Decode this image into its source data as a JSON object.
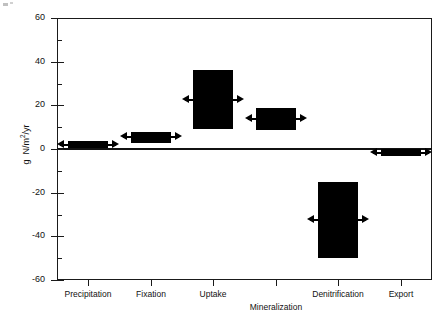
{
  "chart_data": {
    "type": "bar",
    "title": "",
    "xlabel": "",
    "ylabel": "g N/m2/yr",
    "ylabel_parts": {
      "prefix": "g  N/m",
      "sup": "2",
      "suffix": "/yr"
    },
    "categories": [
      "Precipitation",
      "Fixation",
      "Uptake",
      "Mineralization",
      "Denitrification",
      "Export"
    ],
    "ylim": [
      -60,
      60
    ],
    "yticks": [
      60,
      40,
      20,
      0,
      -20,
      -40,
      -60
    ],
    "ytick_labels": [
      "60",
      "40",
      "20",
      "0",
      "-20",
      "-40",
      "-60"
    ],
    "yminor_ticks": [
      50,
      30,
      10,
      -10,
      -30,
      -50
    ],
    "grid": false,
    "legend": false,
    "bars": [
      {
        "name": "Precipitation",
        "low": 0.5,
        "high": 3.5,
        "value": 2.0,
        "arrow": true
      },
      {
        "name": "Fixation",
        "low": 3.0,
        "high": 8.0,
        "value": 5.5,
        "arrow": true
      },
      {
        "name": "Uptake",
        "low": 9.0,
        "high": 36.0,
        "value": 22.5,
        "arrow": true
      },
      {
        "name": "Mineralization",
        "low": 9.0,
        "high": 19.0,
        "value": 14.0,
        "arrow": true
      },
      {
        "name": "Denitrification",
        "low": -50.0,
        "high": -15.0,
        "value": -32.5,
        "arrow": true
      },
      {
        "name": "Export",
        "low": -3.0,
        "high": 0.0,
        "value": -1.5,
        "arrow": true
      }
    ]
  },
  "axis": {
    "y_title": "g  N/m2/yr",
    "tick_labels_y": [
      "60",
      "40",
      "20",
      "0",
      "-20",
      "-40",
      "-60"
    ],
    "tick_labels_x": [
      "Precipitation",
      "Fixation",
      "Uptake",
      "Mineralization",
      "Denitrification",
      "Export"
    ]
  }
}
